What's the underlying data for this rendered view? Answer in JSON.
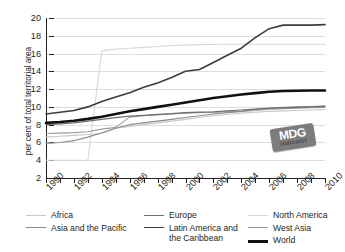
{
  "chart_data": {
    "type": "line",
    "title": "",
    "xlabel": "",
    "ylabel": "per cent of total territorial area",
    "xlim": [
      1990,
      2010
    ],
    "ylim": [
      2,
      20
    ],
    "grid": true,
    "legend_position": "bottom",
    "x": [
      1990,
      1991,
      1992,
      1993,
      1994,
      1995,
      1996,
      1997,
      1998,
      1999,
      2000,
      2001,
      2002,
      2003,
      2004,
      2005,
      2006,
      2007,
      2008,
      2009,
      2010
    ],
    "ytick_labels": [
      "20",
      "18",
      "16",
      "14",
      "12",
      "10",
      "8",
      "6",
      "4",
      "2"
    ],
    "ytick_values": [
      20,
      18,
      16,
      14,
      12,
      10,
      8,
      6,
      4,
      2
    ],
    "xtick_labels": [
      "1990",
      "1992",
      "1994",
      "1996",
      "1998",
      "2000",
      "2002",
      "2004",
      "2006",
      "2008",
      "2010"
    ],
    "xtick_values": [
      1990,
      1992,
      1994,
      1996,
      1998,
      2000,
      2002,
      2004,
      2006,
      2008,
      2010
    ],
    "series": [
      {
        "name": "Africa",
        "color": "#c9c9c9",
        "width": 1.1,
        "values": [
          6.6,
          6.7,
          6.8,
          6.9,
          7.0,
          7.6,
          7.8,
          8.0,
          8.2,
          8.4,
          8.6,
          8.8,
          9.0,
          9.15,
          9.3,
          9.4,
          9.5,
          9.55,
          9.6,
          9.65,
          9.7
        ]
      },
      {
        "name": "Asia and the Pacific",
        "color": "#8a8a8a",
        "width": 1.1,
        "values": [
          5.9,
          6.0,
          6.2,
          6.6,
          7.1,
          7.6,
          8.0,
          8.2,
          8.4,
          8.6,
          8.8,
          9.0,
          9.2,
          9.35,
          9.5,
          9.7,
          9.85,
          9.95,
          10.0,
          10.05,
          10.1
        ]
      },
      {
        "name": "Europe",
        "color": "#6e6e6e",
        "width": 1.2,
        "values": [
          8.0,
          8.1,
          8.2,
          8.4,
          8.6,
          8.8,
          8.95,
          9.05,
          9.15,
          9.25,
          9.35,
          9.4,
          9.45,
          9.55,
          9.65,
          9.75,
          9.85,
          9.9,
          9.95,
          10.0,
          10.05
        ]
      },
      {
        "name": "Latin America and the Caribbean",
        "color": "#3c3c3c",
        "width": 1.6,
        "values": [
          9.2,
          9.4,
          9.6,
          10.0,
          10.6,
          11.1,
          11.6,
          12.2,
          12.7,
          13.3,
          14.0,
          14.2,
          15.0,
          15.8,
          16.6,
          17.8,
          18.8,
          19.2,
          19.2,
          19.2,
          19.25
        ]
      },
      {
        "name": "North America",
        "color": "#d8d8d8",
        "width": 1.1,
        "values": [
          4.0,
          4.0,
          4.0,
          4.0,
          16.3,
          16.5,
          16.6,
          16.7,
          16.8,
          16.9,
          16.95,
          17.0,
          17.02,
          17.04,
          17.05,
          17.05,
          17.05,
          17.05,
          17.05,
          17.05,
          17.05
        ]
      },
      {
        "name": "West Asia",
        "color": "#9c9c9c",
        "width": 1.1,
        "values": [
          7.0,
          7.05,
          7.1,
          7.2,
          7.5,
          7.7,
          8.85,
          9.0,
          9.1,
          9.2,
          9.3,
          9.35,
          9.4,
          9.45,
          9.5,
          9.6,
          9.75,
          9.8,
          9.85,
          9.9,
          9.95
        ]
      },
      {
        "name": "World",
        "color": "#111111",
        "width": 2.6,
        "values": [
          8.2,
          8.3,
          8.45,
          8.65,
          8.9,
          9.2,
          9.5,
          9.75,
          10.0,
          10.25,
          10.5,
          10.75,
          11.0,
          11.2,
          11.4,
          11.55,
          11.7,
          11.78,
          11.82,
          11.85,
          11.85
        ]
      }
    ]
  },
  "badge": {
    "main": "MDG",
    "sub": "indicator"
  },
  "legend": {
    "columns": [
      [
        {
          "label": "Africa",
          "color": "#c9c9c9",
          "width": 1.1
        },
        {
          "label": "Asia and the Pacific",
          "color": "#8a8a8a",
          "width": 1.4
        }
      ],
      [
        {
          "label": "Europe",
          "color": "#6e6e6e",
          "width": 1.5
        },
        {
          "label": "Latin America and the Caribbean",
          "color": "#3c3c3c",
          "width": 1.9
        }
      ],
      [
        {
          "label": "North America",
          "color": "#d8d8d8",
          "width": 1.1
        },
        {
          "label": "West Asia",
          "color": "#9c9c9c",
          "width": 1.4
        },
        {
          "label": "World",
          "color": "#111111",
          "width": 3
        }
      ]
    ]
  }
}
